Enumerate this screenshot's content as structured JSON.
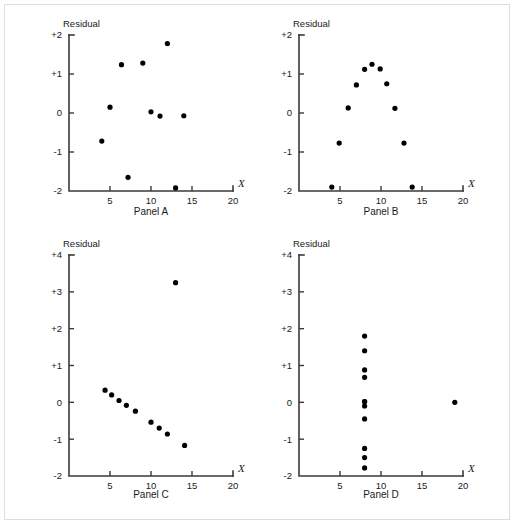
{
  "figure": {
    "background_color": "#ffffff",
    "frame_color": "#dededd",
    "point_color": "#000000",
    "axis_color": "#3a3a3a"
  },
  "chart_data": [
    {
      "type": "scatter",
      "title": "Panel A",
      "caption": "Panel A",
      "xlabel": "X",
      "ylabel": "Residual",
      "xlim": [
        0,
        20
      ],
      "ylim": [
        -2,
        2
      ],
      "xticks": [
        5,
        10,
        15,
        20
      ],
      "xtick_labels": [
        "5",
        "10",
        "15",
        "20"
      ],
      "yticks": [
        -2,
        -1,
        0,
        1,
        2
      ],
      "ytick_labels": [
        "-2",
        "-1",
        "0",
        "+1",
        "+2"
      ],
      "grid": false,
      "legend": "none",
      "x": [
        4.0,
        5.0,
        6.4,
        7.2,
        9.0,
        10.0,
        11.1,
        12.0,
        13.0,
        14.0
      ],
      "y": [
        -0.72,
        0.15,
        1.24,
        -1.65,
        1.28,
        0.03,
        -0.08,
        1.78,
        -1.92,
        -0.07
      ]
    },
    {
      "type": "scatter",
      "title": "Panel B",
      "caption": "Panel B",
      "xlabel": "X",
      "ylabel": "Residual",
      "xlim": [
        0,
        20
      ],
      "ylim": [
        -2,
        2
      ],
      "xticks": [
        5,
        10,
        15,
        20
      ],
      "xtick_labels": [
        "5",
        "10",
        "15",
        "20"
      ],
      "yticks": [
        -2,
        -1,
        0,
        1,
        2
      ],
      "ytick_labels": [
        "-2",
        "-1",
        "0",
        "+1",
        "+2"
      ],
      "grid": false,
      "legend": "none",
      "x": [
        4.0,
        4.9,
        6.0,
        7.0,
        8.0,
        8.9,
        9.9,
        10.7,
        11.7,
        12.8,
        13.8
      ],
      "y": [
        -1.9,
        -0.77,
        0.13,
        0.72,
        1.12,
        1.25,
        1.13,
        0.75,
        0.12,
        -0.77,
        -1.9
      ]
    },
    {
      "type": "scatter",
      "title": "Panel C",
      "caption": "Panel C",
      "xlabel": "X",
      "ylabel": "Residual",
      "xlim": [
        0,
        20
      ],
      "ylim": [
        -2,
        4
      ],
      "xticks": [
        5,
        10,
        15,
        20
      ],
      "xtick_labels": [
        "5",
        "10",
        "15",
        "20"
      ],
      "yticks": [
        -2,
        -1,
        0,
        1,
        2,
        3,
        4
      ],
      "ytick_labels": [
        "-2",
        "-1",
        "0",
        "+1",
        "+2",
        "+3",
        "+4"
      ],
      "grid": false,
      "legend": "none",
      "x": [
        4.4,
        5.2,
        6.1,
        7.0,
        8.1,
        10.0,
        11.0,
        12.0,
        13.0,
        14.1
      ],
      "y": [
        0.33,
        0.2,
        0.05,
        -0.08,
        -0.24,
        -0.54,
        -0.7,
        -0.86,
        3.25,
        -1.17
      ]
    },
    {
      "type": "scatter",
      "title": "Panel D",
      "caption": "Panel D",
      "xlabel": "X",
      "ylabel": "Residual",
      "xlim": [
        0,
        20
      ],
      "ylim": [
        -2,
        4
      ],
      "xticks": [
        5,
        10,
        15,
        20
      ],
      "xtick_labels": [
        "5",
        "10",
        "15",
        "20"
      ],
      "yticks": [
        -2,
        -1,
        0,
        1,
        2,
        3,
        4
      ],
      "ytick_labels": [
        "-2",
        "-1",
        "0",
        "+1",
        "+2",
        "+3",
        "+4"
      ],
      "grid": false,
      "legend": "none",
      "x": [
        8.0,
        8.0,
        8.0,
        8.0,
        8.0,
        8.0,
        8.0,
        8.0,
        8.0,
        8.0,
        8.0,
        19.0
      ],
      "y": [
        1.8,
        1.4,
        0.88,
        0.68,
        0.02,
        -0.1,
        -0.45,
        -1.25,
        -1.5,
        -1.78,
        0.02,
        0.0
      ]
    }
  ]
}
